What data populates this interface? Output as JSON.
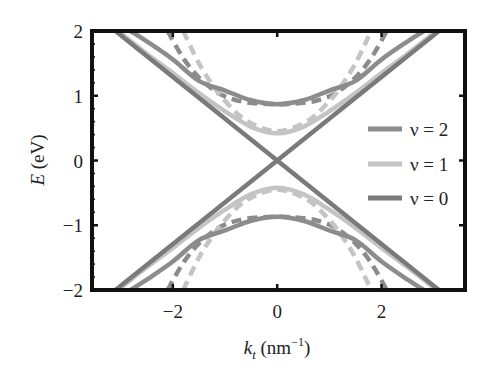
{
  "chart_data": {
    "type": "line",
    "title": "",
    "xlabel": "k_t (nm^-1)",
    "xlabel_parts": {
      "main": "k",
      "sub": "t",
      "unit": " (nm",
      "sup": "−1",
      "close": ")"
    },
    "ylabel": "E (eV)",
    "ylabel_parts": {
      "main": "E",
      "unit": " (eV)"
    },
    "xlim": [
      -3.55,
      3.6
    ],
    "ylim": [
      -2,
      2
    ],
    "xticks": [
      -2,
      0,
      2
    ],
    "xtick_labels": [
      "−2",
      "0",
      "2"
    ],
    "yticks": [
      2,
      1,
      0,
      -1,
      -2
    ],
    "ytick_labels": [
      "2",
      "1",
      "0",
      "−1",
      "−2"
    ],
    "grid": false,
    "legend_position": "right-center inside",
    "legend": [
      {
        "label": "ν = 2",
        "color": "#8c8c8c"
      },
      {
        "label": "ν = 1",
        "color": "#c4c4c4"
      },
      {
        "label": "ν = 0",
        "color": "#7a7a7a"
      }
    ],
    "series": [
      {
        "name": "ν = 0",
        "style": "solid",
        "color": "#7a7a7a",
        "description": "linear Dirac cone, E = ±0.64·k",
        "branches": [
          {
            "x": [
              -3.1,
              0,
              3.1
            ],
            "y": [
              2.0,
              0.0,
              -2.0
            ]
          },
          {
            "x": [
              -3.1,
              0,
              3.1
            ],
            "y": [
              -2.0,
              0.0,
              2.0
            ]
          }
        ]
      },
      {
        "name": "ν = 2",
        "style": "solid",
        "color": "#8c8c8c",
        "description": "gapped band, min |E| ≈ 0.87 at k = 0",
        "gap": 0.87,
        "velocity": 0.64,
        "x": [
          -2.81,
          -2.5,
          -2.0,
          -1.5,
          -1.0,
          -0.5,
          0.0,
          0.5,
          1.0,
          1.5,
          2.0,
          2.5,
          2.81
        ],
        "y_upper": [
          2.0,
          1.84,
          1.56,
          1.23,
          1.08,
          0.93,
          0.87,
          0.93,
          1.08,
          1.23,
          1.56,
          1.84,
          2.0
        ],
        "y_lower": [
          -2.0,
          -1.84,
          -1.56,
          -1.23,
          -1.08,
          -0.93,
          -0.87,
          -0.93,
          -1.08,
          -1.23,
          -1.56,
          -1.84,
          -2.0
        ]
      },
      {
        "name": "ν = 1",
        "style": "solid",
        "color": "#c4c4c4",
        "description": "gapped band, min |E| ≈ 0.42 at k = 0",
        "gap": 0.42,
        "velocity": 0.64,
        "x": [
          -3.05,
          -2.5,
          -2.0,
          -1.5,
          -1.0,
          -0.5,
          0.0,
          0.5,
          1.0,
          1.5,
          2.0,
          2.5,
          3.05
        ],
        "y_upper": [
          2.0,
          1.65,
          1.35,
          1.04,
          0.76,
          0.52,
          0.42,
          0.52,
          0.76,
          1.04,
          1.35,
          1.65,
          2.0
        ],
        "y_lower": [
          -2.0,
          -1.65,
          -1.35,
          -1.04,
          -0.76,
          -0.52,
          -0.42,
          -0.52,
          -0.76,
          -1.04,
          -1.35,
          -1.65,
          -2.0
        ]
      },
      {
        "name": "ν = 2 (dashed)",
        "style": "dashed",
        "color": "#8c8c8c",
        "description": "steeper branch, reaches |E| = 2 at |k| ≈ 2.1",
        "x": [
          -2.1,
          -1.8,
          -1.5,
          -1.2,
          -1.0,
          -0.6,
          0.0,
          0.6,
          1.0,
          1.2,
          1.5,
          1.8,
          2.1
        ],
        "y_upper": [
          2.0,
          1.58,
          1.28,
          1.08,
          0.99,
          0.9,
          0.87,
          0.9,
          0.99,
          1.08,
          1.28,
          1.58,
          2.0
        ],
        "y_lower": [
          -2.0,
          -1.58,
          -1.28,
          -1.08,
          -0.99,
          -0.9,
          -0.87,
          -0.9,
          -0.99,
          -1.08,
          -1.28,
          -1.58,
          -2.0
        ]
      },
      {
        "name": "ν = 1 (dashed)",
        "style": "dashed",
        "color": "#c4c4c4",
        "description": "steeper branch, reaches |E| = 2 at |k| ≈ 1.8",
        "x": [
          -1.8,
          -1.5,
          -1.2,
          -1.0,
          -0.6,
          0.0,
          0.6,
          1.0,
          1.2,
          1.5,
          1.8
        ],
        "y_upper": [
          2.0,
          1.5,
          1.12,
          0.92,
          0.62,
          0.45,
          0.62,
          0.92,
          1.12,
          1.5,
          2.0
        ],
        "y_lower": [
          -2.0,
          -1.5,
          -1.12,
          -0.92,
          -0.62,
          -0.45,
          -0.62,
          -0.92,
          -1.12,
          -1.5,
          -2.0
        ]
      }
    ]
  },
  "layout": {
    "plot_left": 92,
    "plot_right": 465,
    "plot_top": 31,
    "plot_bottom": 290
  }
}
